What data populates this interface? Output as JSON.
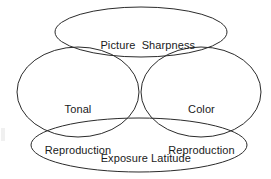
{
  "diagram": {
    "type": "venn-diagram",
    "background_color": "#ffffff",
    "stroke_color": "#2b2b2b",
    "text_color": "#1a1a1a",
    "ellipses": [
      {
        "id": "picture-sharpness",
        "label": "Picture  Sharpness",
        "lines": [
          "Picture  Sharpness"
        ],
        "cx": 141,
        "cy": 32,
        "rx": 86,
        "ry": 25,
        "position": "top"
      },
      {
        "id": "tonal-reproduction",
        "label": "Tonal Reproduction",
        "lines": [
          "Tonal",
          "Reproduction"
        ],
        "cx": 78,
        "cy": 92,
        "rx": 61,
        "ry": 45,
        "position": "left"
      },
      {
        "id": "color-reproduction",
        "label": "Color Reproduction",
        "lines": [
          "Color",
          "Reproduction"
        ],
        "cx": 201,
        "cy": 92,
        "rx": 60,
        "ry": 45,
        "position": "right"
      },
      {
        "id": "exposure-latitude",
        "label": "Exposure Latitude",
        "lines": [
          "Exposure Latitude"
        ],
        "cx": 139,
        "cy": 145,
        "rx": 108,
        "ry": 27,
        "position": "bottom"
      }
    ]
  },
  "labels": {
    "picture_sharpness": "Picture  Sharpness",
    "tonal_line1": "Tonal",
    "tonal_line2": "Reproduction",
    "color_line1": "Color",
    "color_line2": "Reproduction",
    "exposure_latitude": "Exposure Latitude"
  }
}
